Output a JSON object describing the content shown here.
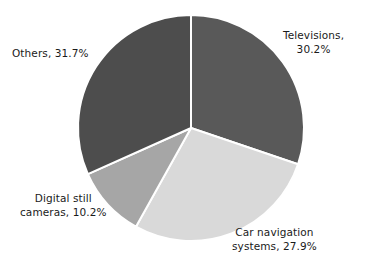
{
  "chart_data": {
    "type": "pie",
    "title": "",
    "subtitle": "",
    "xlabel": "",
    "ylabel": "",
    "grid": false,
    "legend_position": "none",
    "label_format": "{name}, {value}%",
    "units": "percent",
    "total": 100.0,
    "categories": [
      "Televisions",
      "Car navigation systems",
      "Digital still cameras",
      "Others"
    ],
    "values": [
      30.2,
      27.9,
      10.2,
      31.7
    ],
    "colors": [
      "#595959",
      "#d9d9d9",
      "#a6a6a6",
      "#4d4d4d"
    ],
    "start_angle_deg": 0,
    "direction": "clockwise",
    "slices": [
      {
        "name": "Televisions",
        "value": 30.2,
        "color": "#595959",
        "label_line1": "Televisions,",
        "label_line2": "30.2%",
        "label_position": "right-top"
      },
      {
        "name": "Car navigation systems",
        "value": 27.9,
        "color": "#d9d9d9",
        "label_line1": "Car navigation",
        "label_line2": "systems, 27.9%",
        "label_position": "bottom-right"
      },
      {
        "name": "Digital still cameras",
        "value": 10.2,
        "color": "#a6a6a6",
        "label_line1": "Digital still",
        "label_line2": "cameras, 10.2%",
        "label_position": "bottom-left"
      },
      {
        "name": "Others",
        "value": 31.7,
        "color": "#4d4d4d",
        "label_line1": "Others, 31.7%",
        "label_line2": "",
        "label_position": "left-top"
      }
    ],
    "geometry": {
      "center_x": 191,
      "center_y": 128,
      "radius": 113,
      "separator_color": "#ffffff",
      "separator_width": 2,
      "background": "#ffffff"
    }
  }
}
